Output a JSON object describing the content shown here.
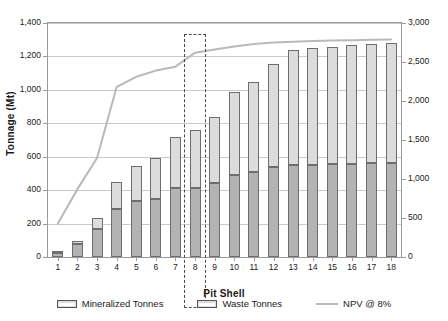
{
  "chart_data": {
    "type": "bar",
    "title": "",
    "xlabel": "Pit Shell",
    "ylabel": "Tonnage (Mt)",
    "y2label": "NPV (M$)",
    "categories": [
      "1",
      "2",
      "3",
      "4",
      "5",
      "6",
      "7",
      "8",
      "9",
      "10",
      "11",
      "12",
      "13",
      "14",
      "15",
      "16",
      "17",
      "18"
    ],
    "ylim": [
      0,
      1400
    ],
    "y2lim": [
      0,
      3000
    ],
    "yticks": [
      "0",
      "200",
      "400",
      "600",
      "800",
      "1,000",
      "1,200",
      "1,400"
    ],
    "ytick_values": [
      0,
      200,
      400,
      600,
      800,
      1000,
      1200,
      1400
    ],
    "y2ticks": [
      "0",
      "500",
      "1,000",
      "1,500",
      "2,000",
      "2,500",
      "3,000"
    ],
    "y2tick_values": [
      0,
      500,
      1000,
      1500,
      2000,
      2500,
      3000
    ],
    "grid": true,
    "legend_position": "bottom",
    "series": [
      {
        "name": "Mineralized Tonnes",
        "type": "bar-stacked",
        "axis": "left",
        "color": "#b3b3b3",
        "values": [
          25,
          80,
          165,
          285,
          335,
          350,
          410,
          415,
          445,
          490,
          510,
          540,
          550,
          550,
          555,
          555,
          560,
          560
        ]
      },
      {
        "name": "Waste Tonnes",
        "type": "bar-stacked",
        "axis": "left",
        "color": "#dcdcdc",
        "values": [
          10,
          15,
          70,
          165,
          210,
          240,
          310,
          345,
          390,
          500,
          535,
          615,
          690,
          700,
          700,
          715,
          715,
          720
        ]
      },
      {
        "name": "NPV @ 8%",
        "type": "line",
        "axis": "right",
        "color": "#b9b9b9",
        "values": [
          430,
          870,
          1270,
          2180,
          2310,
          2390,
          2440,
          2620,
          2660,
          2700,
          2730,
          2750,
          2760,
          2770,
          2775,
          2780,
          2785,
          2790
        ]
      }
    ],
    "totals": [
      35,
      95,
      235,
      450,
      545,
      590,
      720,
      760,
      835,
      990,
      1045,
      1155,
      1240,
      1250,
      1255,
      1270,
      1275,
      1280
    ],
    "annotations": [
      {
        "name": "selected-pit-shell-highlight",
        "type": "dashed-box",
        "category": "8",
        "label": ""
      }
    ]
  },
  "legend": {
    "items": [
      {
        "label": "Mineralized Tonnes",
        "marker": "swatch"
      },
      {
        "label": "Waste Tonnes",
        "marker": "swatch"
      },
      {
        "label": "NPV @ 8%",
        "marker": "line"
      }
    ]
  },
  "colors": {
    "mineralized": "#b3b3b3",
    "waste": "#dcdcdc",
    "npv_line": "#b9b9b9",
    "bar_border": "#6e6e6e",
    "grid": "#c9c9c9",
    "axis": "#9a9a9a",
    "highlight": "#4a4a4a",
    "background": "#ffffff"
  }
}
